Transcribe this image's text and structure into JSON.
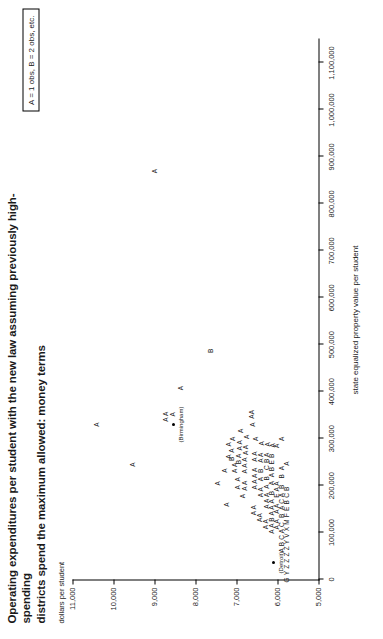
{
  "figure": {
    "title_line1": "Operating expenditures per student with the new law assuming previously high-spending",
    "title_line2": "districts spend the maximum allowed: money terms",
    "legend_text": "A = 1 obs, B = 2 obs, etc."
  },
  "chart_data": {
    "type": "scatter",
    "title": "Operating expenditures per student with the new law assuming previously high-spending districts spend the maximum allowed: money terms",
    "xlabel": "state equalized property value per student",
    "ylabel": "dollars per student",
    "xlim": [
      0,
      1150000
    ],
    "ylim": [
      5000,
      11000
    ],
    "grid": false,
    "legend": "A = 1 obs, B = 2 obs, etc.",
    "legend_position": "top-right",
    "xticks": [
      0,
      100000,
      200000,
      300000,
      400000,
      500000,
      600000,
      700000,
      800000,
      900000,
      1000000,
      1100000
    ],
    "xticklabels": [
      "0",
      "100,000",
      "200,000",
      "300,000",
      "400,000",
      "500,000",
      "600,000",
      "700,000",
      "800,000",
      "900,000",
      "1,000,000",
      "1,100,000"
    ],
    "yticks": [
      5000,
      6000,
      7000,
      8000,
      9000,
      10000,
      11000
    ],
    "yticklabels": [
      "5,000",
      "6,000",
      "7,000",
      "8,000",
      "9,000",
      "10,000",
      "11,000"
    ],
    "annotations": [
      {
        "text": "(Detroit)",
        "x": 36000,
        "y": 6090
      },
      {
        "text": "(Birmingham)",
        "x": 330000,
        "y": 8530
      }
    ],
    "marker_note": "Glyph letters encode overplot counts: A = 1 obs, B = 2 obs, C = 3 obs, etc.",
    "points": [
      {
        "label": "A",
        "x": 330000,
        "y": 10380
      },
      {
        "label": "A",
        "x": 245000,
        "y": 9510
      },
      {
        "label": "A",
        "x": 870000,
        "y": 8980
      },
      {
        "label": "A A",
        "x": 347000,
        "y": 8700
      },
      {
        "label": "A",
        "x": 352000,
        "y": 8530
      },
      {
        "label": "A",
        "x": 408000,
        "y": 8330
      },
      {
        "label": "B",
        "x": 487000,
        "y": 7610
      },
      {
        "label": "A",
        "x": 205000,
        "y": 7440
      },
      {
        "label": "A",
        "x": 232000,
        "y": 7280
      },
      {
        "label": "A",
        "x": 160000,
        "y": 7230
      },
      {
        "label": "A",
        "x": 262000,
        "y": 7180
      },
      {
        "label": "A",
        "x": 288000,
        "y": 7170
      },
      {
        "label": "B  A",
        "x": 266000,
        "y": 7090
      },
      {
        "label": "A",
        "x": 300000,
        "y": 7080
      },
      {
        "label": "A A",
        "x": 238000,
        "y": 7020
      },
      {
        "label": "A  A",
        "x": 205000,
        "y": 6950
      },
      {
        "label": "B A",
        "x": 257000,
        "y": 6930
      },
      {
        "label": "A A",
        "x": 286000,
        "y": 6910
      },
      {
        "label": "A",
        "x": 317000,
        "y": 6890
      },
      {
        "label": "A",
        "x": 178000,
        "y": 6820
      },
      {
        "label": "A A",
        "x": 200000,
        "y": 6790
      },
      {
        "label": "A A A",
        "x": 243000,
        "y": 6780
      },
      {
        "label": "A A",
        "x": 276000,
        "y": 6760
      },
      {
        "label": "A",
        "x": 304000,
        "y": 6740
      },
      {
        "label": "AA",
        "x": 352000,
        "y": 6620
      },
      {
        "label": "A",
        "x": 330000,
        "y": 6580
      },
      {
        "label": "A A",
        "x": 148000,
        "y": 6560
      },
      {
        "label": "A A A A",
        "x": 215000,
        "y": 6540
      },
      {
        "label": "A A",
        "x": 262000,
        "y": 6530
      },
      {
        "label": "A",
        "x": 300000,
        "y": 6520
      },
      {
        "label": "AA",
        "x": 132000,
        "y": 6420
      },
      {
        "label": "A A",
        "x": 186000,
        "y": 6400
      },
      {
        "label": "A  B   A A",
        "x": 240000,
        "y": 6390
      },
      {
        "label": "A",
        "x": 290000,
        "y": 6370
      },
      {
        "label": "A A",
        "x": 118000,
        "y": 6270
      },
      {
        "label": "A A A",
        "x": 168000,
        "y": 6250
      },
      {
        "label": "A  B   C B A",
        "x": 232000,
        "y": 6240
      },
      {
        "label": "A",
        "x": 288000,
        "y": 6230
      },
      {
        "label": "A A B A A",
        "x": 128000,
        "y": 6120
      },
      {
        "label": "A  B   A  A B E B",
        "x": 215000,
        "y": 6110
      },
      {
        "label": "A",
        "x": 286000,
        "y": 6100
      },
      {
        "label": "A A   A A   E A A",
        "x": 158000,
        "y": 6000
      },
      {
        "label": "A",
        "x": 285000,
        "y": 5990
      },
      {
        "label": "A B C A C  B  A C A  B   B  A",
        "x": 150000,
        "y": 5880
      },
      {
        "label": "A",
        "x": 300000,
        "y": 5870
      },
      {
        "label": "G Y Z Z Z Z Y V X M F E B C B",
        "x": 96000,
        "y": 5760
      },
      {
        "label": "A",
        "x": 247000,
        "y": 5750
      }
    ]
  }
}
